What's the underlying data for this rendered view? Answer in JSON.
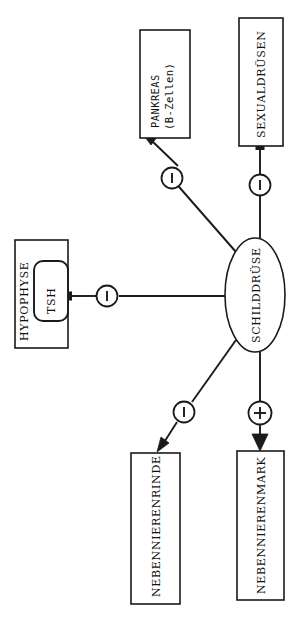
{
  "diagram": {
    "orientation": "rotated-90-ccw",
    "background_color": "#ffffff",
    "line_color": "#1a1a1a",
    "nodes": [
      {
        "id": "pankreas",
        "name": "pankreas-node",
        "shape": "rect",
        "label_line1": "PANKREAS",
        "label_line2": "(B-Zellen)"
      },
      {
        "id": "sexualdruesen",
        "name": "sexualdruesen-node",
        "shape": "rect",
        "label": "SEXUALDRÜSEN"
      },
      {
        "id": "hypophyse",
        "name": "hypophyse-node",
        "shape": "rect",
        "label": "HYPOPHYSE"
      },
      {
        "id": "tsh",
        "name": "tsh-node",
        "shape": "rounded-rect",
        "label": "TSH"
      },
      {
        "id": "schilddruese",
        "name": "schilddruese-node",
        "shape": "ellipse",
        "label": "SCHILDDRÜSE"
      },
      {
        "id": "nebennierenrinde",
        "name": "nebennierenrinde-node",
        "shape": "rect",
        "label": "NEBENNIERENRINDE"
      },
      {
        "id": "nebennierenmark",
        "name": "nebennierenmark-node",
        "shape": "rect",
        "label": "NEBENNIERENMARK"
      }
    ],
    "edges": [
      {
        "id": "edge-pankreas",
        "from": "schilddruese",
        "to": "pankreas",
        "sign": "−",
        "sign_kind": "minus",
        "arrow": true
      },
      {
        "id": "edge-sexualdruesen",
        "from": "schilddruese",
        "to": "sexualdruesen",
        "sign": "−",
        "sign_kind": "minus",
        "arrow": false
      },
      {
        "id": "edge-tsh",
        "from": "schilddruese",
        "to": "tsh",
        "sign": "−",
        "sign_kind": "minus",
        "arrow": false
      },
      {
        "id": "edge-nebennierenrinde",
        "from": "schilddruese",
        "to": "nebennierenrinde",
        "sign": "−",
        "sign_kind": "minus",
        "arrow": true
      },
      {
        "id": "edge-nebennierenmark",
        "from": "schilddruese",
        "to": "nebennierenmark",
        "sign": "+",
        "sign_kind": "plus",
        "arrow": true
      }
    ]
  }
}
